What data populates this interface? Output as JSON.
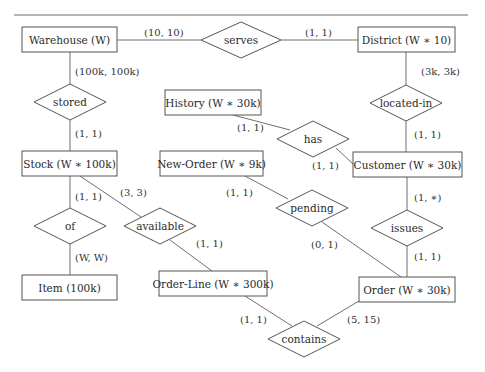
{
  "diagram": {
    "type": "entity-relationship",
    "entities": [
      {
        "id": "warehouse",
        "label": "Warehouse (W)"
      },
      {
        "id": "district",
        "label": "District (W ∗ 10)"
      },
      {
        "id": "history",
        "label": "History (W ∗ 30k)"
      },
      {
        "id": "stock",
        "label": "Stock (W ∗ 100k)"
      },
      {
        "id": "new_order",
        "label": "New-Order (W ∗ 9k)"
      },
      {
        "id": "customer",
        "label": "Customer (W ∗ 30k)"
      },
      {
        "id": "item",
        "label": "Item (100k)"
      },
      {
        "id": "order_line",
        "label": "Order-Line (W ∗ 300k)"
      },
      {
        "id": "order",
        "label": "Order (W ∗ 30k)"
      }
    ],
    "relationships": [
      {
        "id": "serves",
        "label": "serves"
      },
      {
        "id": "stored",
        "label": "stored"
      },
      {
        "id": "located_in",
        "label": "located-in"
      },
      {
        "id": "has",
        "label": "has"
      },
      {
        "id": "of",
        "label": "of"
      },
      {
        "id": "available",
        "label": "available"
      },
      {
        "id": "pending",
        "label": "pending"
      },
      {
        "id": "issues",
        "label": "issues"
      },
      {
        "id": "contains",
        "label": "contains"
      }
    ],
    "cardinalities": {
      "warehouse_serves": "(10, 10)",
      "district_serves": "(1, 1)",
      "warehouse_stored": "(100k, 100k)",
      "stock_stored": "(1, 1)",
      "district_located_in": "(3k, 3k)",
      "customer_located_in": "(1, 1)",
      "history_has": "(1, 1)",
      "customer_has": "(1, 1)",
      "stock_of": "(1, 1)",
      "item_of": "(W, W)",
      "stock_available": "(3, 3)",
      "order_line_available": "(1, 1)",
      "new_order_pending": "(1, 1)",
      "order_pending": "(0, 1)",
      "customer_issues": "(1, ∗)",
      "order_issues": "(1, 1)",
      "order_line_contains": "(1, 1)",
      "order_contains": "(5, 15)"
    }
  }
}
